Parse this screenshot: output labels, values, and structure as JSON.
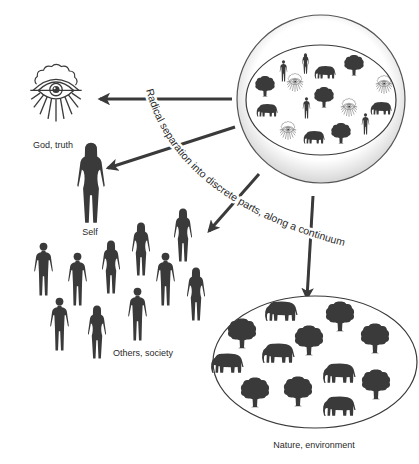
{
  "diagram": {
    "labels": {
      "god": "God, truth",
      "self": "Self",
      "others": "Others, society",
      "nature": "Nature, environment"
    },
    "curved_caption": "Radical separation into discrete parts, along a continuum",
    "colors": {
      "ink": "#3a3a3a",
      "text": "#2a2a2a",
      "background": "#ffffff"
    },
    "whole_sphere_contents": [
      "human figures",
      "elephants",
      "trees",
      "all-seeing eyes"
    ],
    "nature_contents": [
      "elephants",
      "trees"
    ],
    "arrows": [
      {
        "from": "whole",
        "to": "god"
      },
      {
        "from": "whole",
        "to": "self"
      },
      {
        "from": "whole",
        "to": "others"
      },
      {
        "from": "whole",
        "to": "nature"
      }
    ]
  }
}
